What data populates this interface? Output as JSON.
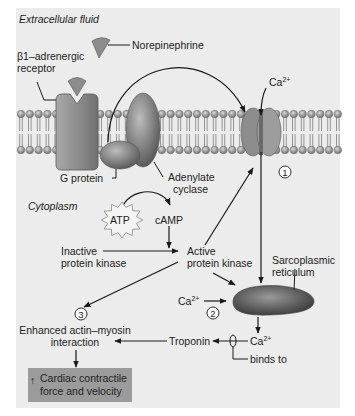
{
  "regions": {
    "extracellular": "Extracellular fluid",
    "cytoplasm": "Cytoplasm"
  },
  "labels": {
    "norepinephrine": "Norepinephrine",
    "receptor_line1": "β1–adrenergic",
    "receptor_line2": "receptor",
    "g_protein": "G protein",
    "adenylate_line1": "Adenylate",
    "adenylate_line2": "cyclase",
    "atp": "ATP",
    "camp": "cAMP",
    "inactive_pk_line1": "Inactive",
    "inactive_pk_line2": "protein kinase",
    "active_pk_line1": "Active",
    "active_pk_line2": "protein kinase",
    "sr_line1": "Sarcoplasmic",
    "sr_line2": "reticulum",
    "ca_top": "Ca",
    "ca_mid": "Ca",
    "ca_bottom": "Ca",
    "ca_sup": "2+",
    "troponin": "Troponin",
    "binds_to": "binds to",
    "actin_line1": "Enhanced actin–myosin",
    "actin_line2": "interaction",
    "result_arrow": "↑",
    "result_line1": "Cardiac contractile",
    "result_line2": "force and velocity"
  },
  "steps": [
    "1",
    "2",
    "3"
  ],
  "colors": {
    "panel": "#ececec",
    "membrane_head": "#9a9a9a",
    "protein": "#8a8a8a",
    "result_box": "#9b9b9b",
    "stroke": "#1a1a1a"
  }
}
